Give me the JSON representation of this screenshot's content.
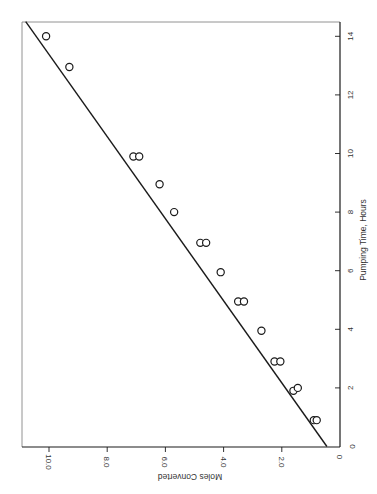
{
  "chart_data": {
    "type": "scatter",
    "orientation": "rotated-90-clockwise",
    "title": "",
    "xlabel": "Pumping Time, Hours",
    "ylabel": "Moles Converted",
    "xlim": [
      0,
      14.5
    ],
    "ylim": [
      0,
      11
    ],
    "x_ticks": [
      0,
      2,
      4,
      6,
      8,
      10,
      12,
      14
    ],
    "x_tick_labels": [
      "0",
      "2",
      "4",
      "6",
      "8",
      "10",
      "12",
      "14"
    ],
    "y_ticks": [
      0,
      2,
      4,
      6,
      8,
      10
    ],
    "y_tick_labels": [
      "0",
      "2.0",
      "4.0",
      "6.0",
      "8.0",
      "10.0"
    ],
    "grid": false,
    "legend": null,
    "series": [
      {
        "name": "Observed",
        "marker": "open-circle",
        "points": [
          {
            "x": 0.9,
            "y": 0.9
          },
          {
            "x": 0.9,
            "y": 0.8
          },
          {
            "x": 1.9,
            "y": 1.6
          },
          {
            "x": 2.0,
            "y": 1.45
          },
          {
            "x": 2.9,
            "y": 2.25
          },
          {
            "x": 2.9,
            "y": 2.05
          },
          {
            "x": 3.95,
            "y": 2.7
          },
          {
            "x": 4.95,
            "y": 3.5
          },
          {
            "x": 4.95,
            "y": 3.3
          },
          {
            "x": 5.95,
            "y": 4.1
          },
          {
            "x": 6.95,
            "y": 4.8
          },
          {
            "x": 6.95,
            "y": 4.6
          },
          {
            "x": 8.0,
            "y": 5.7
          },
          {
            "x": 8.95,
            "y": 6.2
          },
          {
            "x": 9.9,
            "y": 7.1
          },
          {
            "x": 9.9,
            "y": 6.9
          },
          {
            "x": 12.95,
            "y": 9.3
          },
          {
            "x": 14.0,
            "y": 10.1
          }
        ]
      },
      {
        "name": "Fitted line",
        "type": "line",
        "points": [
          {
            "x": 0.0,
            "y": 0.45
          },
          {
            "x": 14.5,
            "y": 10.8
          }
        ]
      }
    ]
  },
  "colors": {
    "ink": "#1a1a1a",
    "frame": "#555555",
    "background": "#ffffff"
  }
}
